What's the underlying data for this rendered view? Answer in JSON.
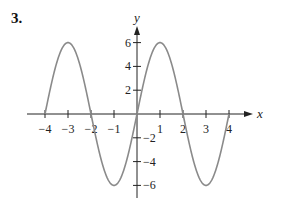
{
  "problem_number": "3.",
  "colors": {
    "curve": "#8a8a8a",
    "axes": "#222222"
  },
  "chart_data": {
    "type": "line",
    "title": "",
    "xlabel": "x",
    "ylabel": "y",
    "xlim": [
      -4,
      4
    ],
    "ylim": [
      -6,
      6
    ],
    "x_ticks": [
      -4,
      -3,
      -2,
      -1,
      1,
      2,
      3,
      4
    ],
    "y_ticks": [
      -6,
      -4,
      -2,
      2,
      4,
      6
    ],
    "x_tick_labels": [
      "−4",
      "−3",
      "−2",
      "−1",
      "1",
      "2",
      "3",
      "4"
    ],
    "y_tick_labels": [
      "−6",
      "−4",
      "−2",
      "2",
      "4",
      "6"
    ],
    "grid": false,
    "series": [
      {
        "name": "y = 6 sin(πx/2)",
        "x": [
          -4,
          -3.5,
          -3,
          -2.5,
          -2,
          -1.5,
          -1,
          -0.5,
          0,
          0.5,
          1,
          1.5,
          2,
          2.5,
          3,
          3.5,
          4
        ],
        "y": [
          0,
          4.24,
          6,
          4.24,
          0,
          -4.24,
          -6,
          -4.24,
          0,
          4.24,
          6,
          4.24,
          0,
          -4.24,
          -6,
          -4.24,
          0
        ]
      }
    ]
  }
}
